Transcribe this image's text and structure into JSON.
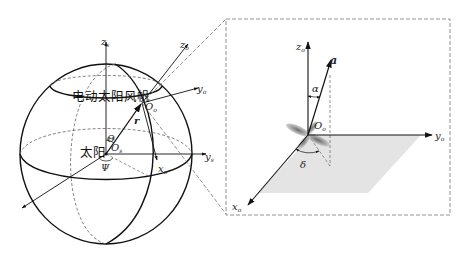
{
  "figure": {
    "left_panel": {
      "title": "heliocentric spherical frame",
      "labels": {
        "sail": "电动太阳风帆",
        "sun": "太阳",
        "zs": "z",
        "zs_sub": "s",
        "ys": "y",
        "ys_sub": "s",
        "Os": "O",
        "Os_sub": "s",
        "Oo": "O",
        "Oo_sub": "o",
        "zo": "z",
        "zo_sub": "o",
        "yo": "y",
        "yo_sub": "o",
        "xo": "x",
        "xo_sub": "o",
        "r": "r",
        "theta": "Θ",
        "psi": "Ψ"
      }
    },
    "right_panel": {
      "title": "orbital frame detail (dashed inset)",
      "labels": {
        "zo": "z",
        "zo_sub": "o",
        "a": "a",
        "alpha": "α",
        "Oo": "O",
        "Oo_sub": "o",
        "yo": "y",
        "yo_sub": "o",
        "xo": "x",
        "xo_sub": "o",
        "delta": "δ"
      }
    },
    "colors": {
      "stroke": "#111111",
      "dashed": "#666666",
      "plane_fill": "#e4e4e4",
      "sail_fill": "#9a9a9a"
    }
  }
}
